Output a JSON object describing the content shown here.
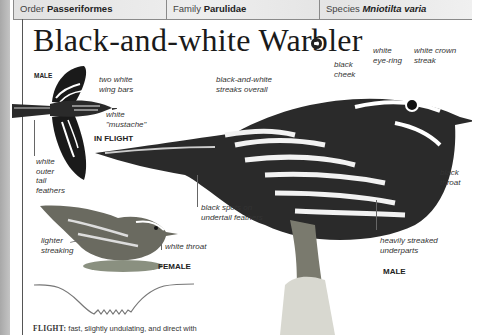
{
  "taxonomy": {
    "order_label": "Order",
    "order_value": "Passeriformes",
    "family_label": "Family",
    "family_value": "Parulidae",
    "species_label": "Species",
    "species_value": "Mniotilta varia"
  },
  "title": "Black-and-white Warbler",
  "audio_icon": "speaker-icon",
  "in_flight_illustration": {
    "sex_label": "MALE",
    "caption": "IN FLIGHT",
    "labels": {
      "wing_bars": [
        "two white",
        "wing bars"
      ],
      "mustache": [
        "white",
        "\"mustache\""
      ],
      "tail": [
        "white",
        "outer",
        "tail",
        "feathers"
      ]
    }
  },
  "male_illustration": {
    "caption": "MALE",
    "labels": {
      "streaks": [
        "black-and-white",
        "streaks overall"
      ],
      "cheek": [
        "black",
        "cheek"
      ],
      "eye_ring": [
        "white",
        "eye-ring"
      ],
      "crown": [
        "white crown",
        "streak"
      ],
      "throat": [
        "black",
        "throat"
      ],
      "undertail": [
        "black spots on",
        "undertail feathers"
      ],
      "underparts": [
        "heavily streaked",
        "underparts"
      ]
    }
  },
  "female_illustration": {
    "caption": "FEMALE",
    "labels": {
      "streaking": [
        "lighter",
        "streaking"
      ],
      "throat": "white throat"
    }
  },
  "flight_pattern": {
    "label": "FLIGHT:",
    "text": " fast, slightly undulating, and direct with"
  }
}
